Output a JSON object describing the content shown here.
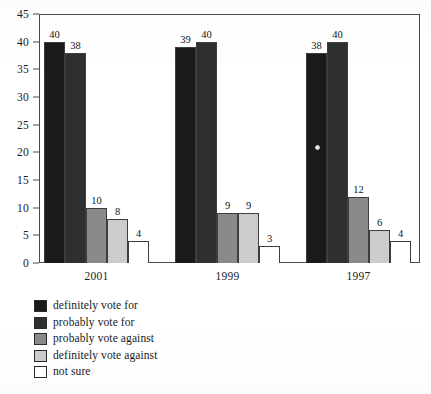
{
  "title_remnant": {
    "part1": "......",
    "part2": "...."
  },
  "axis": {
    "y_ticks": [
      0,
      5,
      10,
      15,
      20,
      25,
      30,
      35,
      40,
      45
    ],
    "x_labels": [
      "2001",
      "1999",
      "1997"
    ]
  },
  "legend": {
    "items": [
      {
        "label": "definitely vote for",
        "color": "#1a1a1a"
      },
      {
        "label": "probably vote for",
        "color": "#2f2f2f"
      },
      {
        "label": "probably vote against",
        "color": "#8a8a8a"
      },
      {
        "label": "definitely vote against",
        "color": "#cccccc"
      },
      {
        "label": "not sure",
        "color": "#ffffff"
      }
    ]
  },
  "chart_data": {
    "type": "bar",
    "title": "",
    "xlabel": "",
    "ylabel": "",
    "ylim": [
      0,
      45
    ],
    "ytick_step": 5,
    "grid": false,
    "legend_position": "below-left",
    "categories": [
      "2001",
      "1999",
      "1997"
    ],
    "series": [
      {
        "name": "definitely vote for",
        "color": "#1a1a1a",
        "values": [
          40,
          39,
          38
        ]
      },
      {
        "name": "probably vote for",
        "color": "#2f2f2f",
        "values": [
          38,
          40,
          40
        ]
      },
      {
        "name": "probably vote against",
        "color": "#8a8a8a",
        "values": [
          10,
          9,
          12
        ]
      },
      {
        "name": "definitely vote against",
        "color": "#cccccc",
        "values": [
          8,
          9,
          6
        ]
      },
      {
        "name": "not sure",
        "color": "#ffffff",
        "values": [
          4,
          3,
          4
        ]
      }
    ],
    "data_labels": [
      [
        40,
        38,
        10,
        8,
        4
      ],
      [
        39,
        40,
        9,
        9,
        3
      ],
      [
        38,
        40,
        12,
        6,
        4
      ]
    ]
  }
}
